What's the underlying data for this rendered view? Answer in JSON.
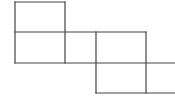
{
  "diagram": {
    "width": 175,
    "height": 101,
    "stroke_color": "#444444",
    "background": "#ffffff",
    "stroke_width": 1.2,
    "lines": [
      {
        "x1": 15,
        "y1": 2,
        "x2": 65,
        "y2": 2
      },
      {
        "x1": 15,
        "y1": 2,
        "x2": 15,
        "y2": 63
      },
      {
        "x1": 65,
        "y1": 2,
        "x2": 65,
        "y2": 63
      },
      {
        "x1": 15,
        "y1": 32,
        "x2": 146,
        "y2": 32
      },
      {
        "x1": 15,
        "y1": 63,
        "x2": 175,
        "y2": 63
      },
      {
        "x1": 96,
        "y1": 32,
        "x2": 96,
        "y2": 93
      },
      {
        "x1": 146,
        "y1": 32,
        "x2": 146,
        "y2": 93
      },
      {
        "x1": 96,
        "y1": 93,
        "x2": 175,
        "y2": 93
      }
    ]
  }
}
